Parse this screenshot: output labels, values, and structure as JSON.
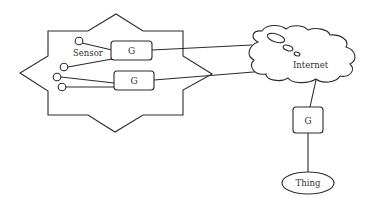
{
  "diagram": {
    "boundary": {
      "shape": "eight-point-star"
    },
    "sensor_label": "Sensor",
    "gateways": [
      {
        "id": "g1",
        "label": "G"
      },
      {
        "id": "g2",
        "label": "G"
      },
      {
        "id": "g3",
        "label": "G"
      }
    ],
    "cloud_label": "Internet",
    "thing_label": "Thing",
    "sensors": [
      {
        "id": "s1",
        "connects_to": "g1"
      },
      {
        "id": "s2",
        "connects_to": "g1"
      },
      {
        "id": "s3",
        "connects_to": "g2"
      },
      {
        "id": "s4",
        "connects_to": "g2"
      }
    ],
    "edges": [
      {
        "from": "g1",
        "to": "Internet"
      },
      {
        "from": "g2",
        "to": "Internet"
      },
      {
        "from": "Internet",
        "to": "g3"
      },
      {
        "from": "g3",
        "to": "Thing"
      }
    ]
  }
}
